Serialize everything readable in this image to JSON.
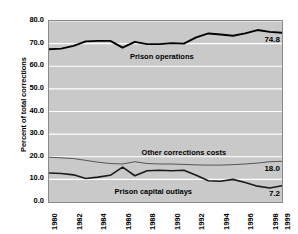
{
  "chart_data": {
    "type": "line",
    "title": "",
    "xlabel": "",
    "ylabel": "Percent of total corrections",
    "ylim": [
      0.0,
      80.0
    ],
    "xlim": [
      1980,
      1999
    ],
    "grid": true,
    "legend_position": "inline-annotations",
    "y_ticks": [
      "0.0",
      "10.0",
      "20.0",
      "30.0",
      "40.0",
      "50.0",
      "60.0",
      "70.0",
      "80.0"
    ],
    "y_tick_values": [
      0.0,
      10.0,
      20.0,
      30.0,
      40.0,
      50.0,
      60.0,
      70.0,
      80.0
    ],
    "x_ticks": [
      "1980",
      "1982",
      "1984",
      "1986",
      "1988",
      "1990",
      "1992",
      "1994",
      "1996",
      "1998",
      "1999"
    ],
    "x_tick_values": [
      1980,
      1982,
      1984,
      1986,
      1988,
      1990,
      1992,
      1994,
      1996,
      1998,
      1999
    ],
    "x": [
      1980,
      1981,
      1982,
      1983,
      1984,
      1985,
      1986,
      1987,
      1988,
      1989,
      1990,
      1991,
      1992,
      1993,
      1994,
      1995,
      1996,
      1997,
      1998,
      1999
    ],
    "series": [
      {
        "name": "Prison operations",
        "end_value": "74.8",
        "values": [
          67.5,
          67.8,
          69.0,
          71.0,
          71.2,
          71.2,
          68.2,
          70.8,
          69.8,
          69.8,
          70.2,
          70.0,
          72.8,
          74.5,
          74.0,
          73.5,
          74.5,
          76.0,
          75.2,
          74.8
        ]
      },
      {
        "name": "Other corrections costs",
        "end_value": "18.0",
        "values": [
          19.8,
          19.5,
          19.2,
          18.4,
          17.6,
          17.0,
          16.8,
          17.8,
          17.0,
          16.8,
          16.8,
          16.6,
          16.4,
          16.3,
          16.3,
          16.5,
          16.8,
          17.2,
          17.8,
          18.0
        ]
      },
      {
        "name": "Prison capital outlays",
        "end_value": "7.2",
        "values": [
          12.8,
          12.6,
          12.0,
          10.4,
          11.0,
          11.8,
          15.4,
          11.6,
          13.8,
          14.0,
          13.8,
          14.0,
          11.8,
          9.4,
          9.2,
          10.0,
          8.6,
          7.0,
          6.2,
          7.2
        ]
      }
    ],
    "annotations": [
      {
        "text": "Prison operations",
        "x": 1989.2,
        "y": 64.0
      },
      {
        "text": "Other corrections costs",
        "x": 1991.0,
        "y": 21.5
      },
      {
        "text": "Prison capital outlays",
        "x": 1988.5,
        "y": 4.6
      }
    ],
    "colors": {
      "plot_background": "#c9c9c9",
      "gridline": "#ffffff",
      "axis": "#8a8a8a",
      "prison_operations": "#000000",
      "other_corrections_costs": "#555555",
      "prison_capital_outlays": "#1a1a1a",
      "text": "#000000"
    }
  }
}
